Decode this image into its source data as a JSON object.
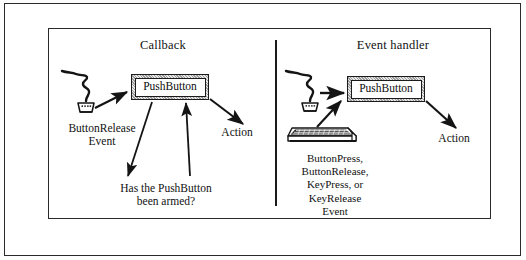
{
  "figure": {
    "type": "diagram",
    "panels": [
      {
        "id": "callback",
        "title": "Callback",
        "widget_label": "PushButton",
        "input_device": "mouse-icon",
        "input_label": "ButtonRelease\nEvent",
        "decision_label": "Has the PushButton\nbeen armed?",
        "output_label": "Action"
      },
      {
        "id": "event-handler",
        "title": "Event handler",
        "widget_label": "PushButton",
        "input_device": "keyboard-icon",
        "secondary_input_device": "mouse-icon",
        "input_label": "ButtonPress,\nButtonRelease,\nKeyPress, or\nKeyRelease\nEvent",
        "output_label": "Action"
      }
    ],
    "colors": {
      "ink": "#1a1a1a",
      "paper": "#ffffff",
      "bevel": "#9a9a9a"
    }
  }
}
